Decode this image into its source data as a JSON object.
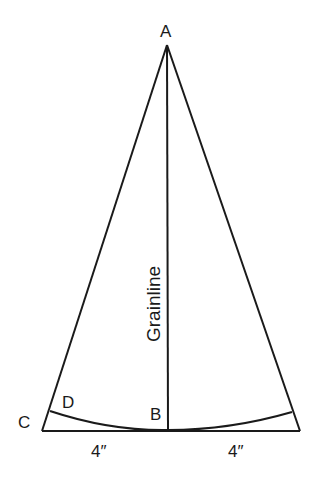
{
  "diagram": {
    "points": {
      "A": {
        "label": "A",
        "x": 167,
        "y": 45
      },
      "B": {
        "label": "B",
        "x": 168,
        "y": 431
      },
      "C": {
        "label": "C",
        "x": 42,
        "y": 431
      },
      "D": {
        "label": "D",
        "x": 50,
        "y": 411
      },
      "E": {
        "x": 300,
        "y": 431
      },
      "F": {
        "x": 292,
        "y": 412
      }
    },
    "labels": {
      "apex": "A",
      "center_bottom": "B",
      "left_corner": "C",
      "arc_start": "D",
      "grainline": "Grainline",
      "left_measure": "4″",
      "right_measure": "4″"
    },
    "stroke_color": "#1a1a1a",
    "background": "#ffffff"
  }
}
